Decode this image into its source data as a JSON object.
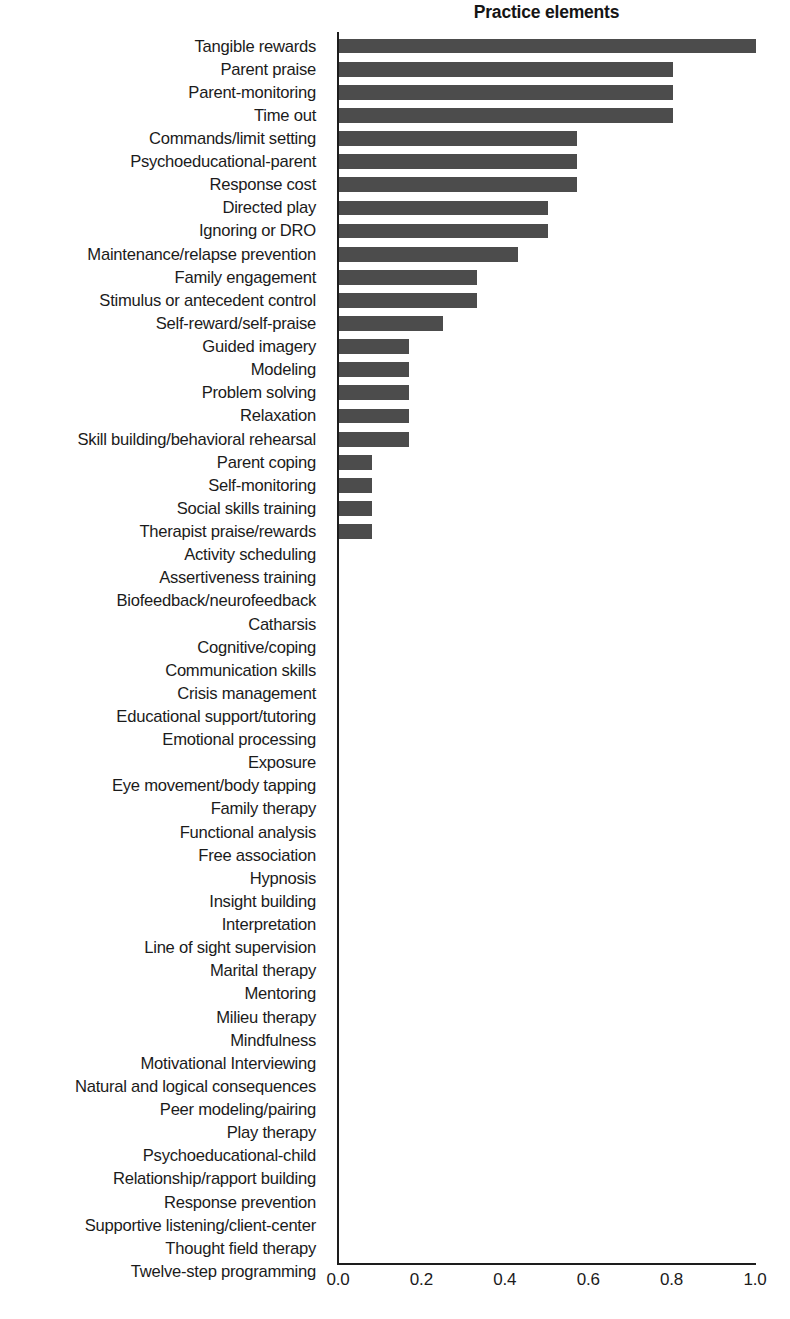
{
  "chart_data": {
    "type": "bar",
    "orientation": "horizontal",
    "title": "Practice elements",
    "xlabel": "",
    "ylabel": "",
    "xlim": [
      0.0,
      1.0
    ],
    "xticks": [
      "0.0",
      "0.2",
      "0.4",
      "0.6",
      "0.8",
      "1.0"
    ],
    "xtick_values": [
      0.0,
      0.2,
      0.4,
      0.6,
      0.8,
      1.0
    ],
    "grid": false,
    "legend": false,
    "bar_color": "#4c4c4c",
    "axis_color": "#1d1d1d",
    "background": "#ffffff",
    "categories": [
      "Tangible rewards",
      "Parent praise",
      "Parent-monitoring",
      "Time out",
      "Commands/limit setting",
      "Psychoeducational-parent",
      "Response cost",
      "Directed play",
      "Ignoring or DRO",
      "Maintenance/relapse prevention",
      "Family engagement",
      "Stimulus or antecedent control",
      "Self-reward/self-praise",
      "Guided imagery",
      "Modeling",
      "Problem solving",
      "Relaxation",
      "Skill building/behavioral rehearsal",
      "Parent coping",
      "Self-monitoring",
      "Social skills training",
      "Therapist praise/rewards",
      "Activity scheduling",
      "Assertiveness training",
      "Biofeedback/neurofeedback",
      "Catharsis",
      "Cognitive/coping",
      "Communication skills",
      "Crisis management",
      "Educational support/tutoring",
      "Emotional processing",
      "Exposure",
      "Eye movement/body tapping",
      "Family therapy",
      "Functional analysis",
      "Free association",
      "Hypnosis",
      "Insight building",
      "Interpretation",
      "Line of sight supervision",
      "Marital therapy",
      "Mentoring",
      "Milieu therapy",
      "Mindfulness",
      "Motivational Interviewing",
      "Natural and logical consequences",
      "Peer modeling/pairing",
      "Play therapy",
      "Psychoeducational-child",
      "Relationship/rapport building",
      "Response prevention",
      "Supportive listening/client-center",
      "Thought field therapy",
      "Twelve-step programming"
    ],
    "values": [
      1.0,
      0.8,
      0.8,
      0.8,
      0.57,
      0.57,
      0.57,
      0.5,
      0.5,
      0.43,
      0.33,
      0.33,
      0.25,
      0.167,
      0.167,
      0.167,
      0.167,
      0.167,
      0.08,
      0.08,
      0.08,
      0.08,
      0.0,
      0.0,
      0.0,
      0.0,
      0.0,
      0.0,
      0.0,
      0.0,
      0.0,
      0.0,
      0.0,
      0.0,
      0.0,
      0.0,
      0.0,
      0.0,
      0.0,
      0.0,
      0.0,
      0.0,
      0.0,
      0.0,
      0.0,
      0.0,
      0.0,
      0.0,
      0.0,
      0.0,
      0.0,
      0.0,
      0.0,
      0.0
    ]
  }
}
